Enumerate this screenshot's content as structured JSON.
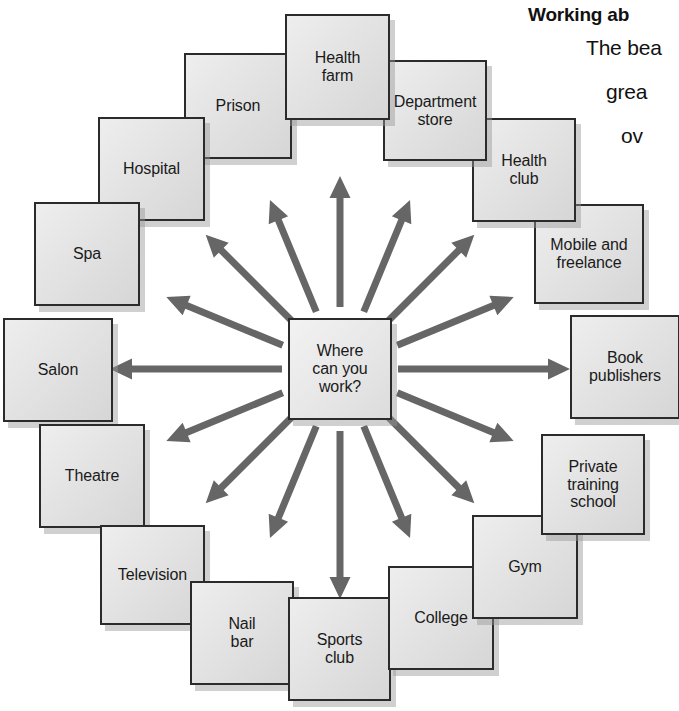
{
  "diagram": {
    "type": "radial-mind-map",
    "center": {
      "label": "Where\ncan you\nwork?",
      "x": 288,
      "y": 318,
      "w": 104,
      "h": 102
    },
    "arrow_color": "#666666",
    "box_fill": "#e3e3e3",
    "box_border": "#2b2b2b",
    "background": "#ffffff",
    "nodes": [
      {
        "label": "Health\nfarm",
        "x": 285,
        "y": 14,
        "w": 105,
        "h": 106,
        "angle": 270,
        "z": 22
      },
      {
        "label": "Department\nstore",
        "x": 383,
        "y": 60,
        "w": 104,
        "h": 101,
        "angle": 292.5,
        "z": 21
      },
      {
        "label": "Health\nclub",
        "x": 472,
        "y": 118,
        "w": 104,
        "h": 104,
        "angle": 315,
        "z": 20
      },
      {
        "label": "Mobile and\nfreelance",
        "x": 534,
        "y": 204,
        "w": 110,
        "h": 100,
        "angle": 337.5,
        "z": 19
      },
      {
        "label": "Book\npublishers",
        "x": 570,
        "y": 315,
        "w": 110,
        "h": 104,
        "angle": 0,
        "z": 18
      },
      {
        "label": "Private\ntraining\nschool",
        "x": 541,
        "y": 434,
        "w": 104,
        "h": 101,
        "angle": 22.5,
        "z": 17
      },
      {
        "label": "Gym",
        "x": 472,
        "y": 515,
        "w": 106,
        "h": 104,
        "angle": 45,
        "z": 16
      },
      {
        "label": "College",
        "x": 388,
        "y": 566,
        "w": 106,
        "h": 104,
        "angle": 67.5,
        "z": 15
      },
      {
        "label": "Sports\nclub",
        "x": 288,
        "y": 597,
        "w": 103,
        "h": 104,
        "angle": 90,
        "z": 14
      },
      {
        "label": "Nail\nbar",
        "x": 190,
        "y": 581,
        "w": 104,
        "h": 104,
        "angle": 112.5,
        "z": 13
      },
      {
        "label": "Television",
        "x": 100,
        "y": 525,
        "w": 105,
        "h": 100,
        "angle": 135,
        "z": 12
      },
      {
        "label": "Theatre",
        "x": 39,
        "y": 424,
        "w": 106,
        "h": 104,
        "angle": 157.5,
        "z": 11
      },
      {
        "label": "Salon",
        "x": 3,
        "y": 318,
        "w": 110,
        "h": 104,
        "angle": 180,
        "z": 10
      },
      {
        "label": "Spa",
        "x": 34,
        "y": 202,
        "w": 106,
        "h": 104,
        "angle": 202.5,
        "z": 9
      },
      {
        "label": "Hospital",
        "x": 98,
        "y": 117,
        "w": 107,
        "h": 104,
        "angle": 225,
        "z": 8
      },
      {
        "label": "Prison",
        "x": 184,
        "y": 53,
        "w": 108,
        "h": 106,
        "angle": 247.5,
        "z": 7
      }
    ],
    "arrows": [
      {
        "angle": 270,
        "inner": 62,
        "outer": 193
      },
      {
        "angle": 292.5,
        "inner": 62,
        "outer": 183
      },
      {
        "angle": 315,
        "inner": 68,
        "outer": 190
      },
      {
        "angle": 337.5,
        "inner": 62,
        "outer": 188
      },
      {
        "angle": 0,
        "inner": 58,
        "outer": 230
      },
      {
        "angle": 22.5,
        "inner": 62,
        "outer": 188
      },
      {
        "angle": 45,
        "inner": 68,
        "outer": 190
      },
      {
        "angle": 67.5,
        "inner": 62,
        "outer": 183
      },
      {
        "angle": 90,
        "inner": 62,
        "outer": 230
      },
      {
        "angle": 112.5,
        "inner": 62,
        "outer": 183
      },
      {
        "angle": 135,
        "inner": 68,
        "outer": 190
      },
      {
        "angle": 157.5,
        "inner": 62,
        "outer": 188
      },
      {
        "angle": 180,
        "inner": 58,
        "outer": 230
      },
      {
        "angle": 202.5,
        "inner": 62,
        "outer": 188
      },
      {
        "angle": 225,
        "inner": 68,
        "outer": 190
      },
      {
        "angle": 247.5,
        "inner": 62,
        "outer": 183
      }
    ]
  },
  "side_text": {
    "heading": "Working ab",
    "line1": "The bea",
    "line2": "grea",
    "line3": "ov"
  }
}
